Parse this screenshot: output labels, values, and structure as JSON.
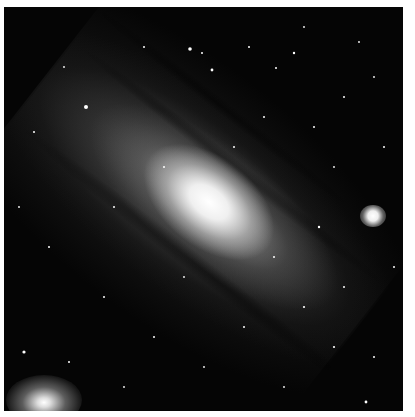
{
  "image": {
    "subject": "spiral galaxy with two satellite galaxies",
    "style": "grayscale astrophotograph",
    "colors": {
      "background": "#050505",
      "border": "#ffffff",
      "core": "#ffffff"
    },
    "features": [
      {
        "name": "galaxy-core",
        "x": 205,
        "y": 200
      },
      {
        "name": "satellite-galaxy-right",
        "x": 373,
        "y": 215
      },
      {
        "name": "satellite-galaxy-bottom-left",
        "x": 40,
        "y": 400
      }
    ]
  }
}
